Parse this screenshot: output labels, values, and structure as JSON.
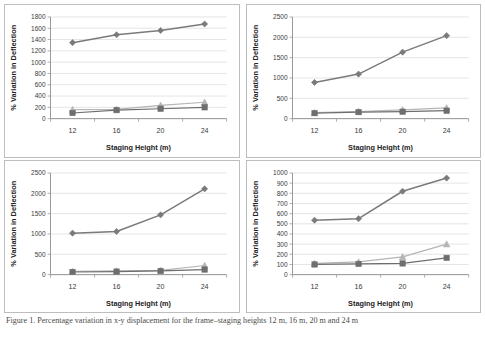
{
  "figure": {
    "caption": "Figure 1.  Percentage variation in x-y displacement for the frame–staging heights 12 m, 16 m, 20 m and 24 m",
    "background": "#ffffff",
    "panel_border": "#bdbdbd"
  },
  "style": {
    "series_colors": {
      "diamond": "#7a7a7a",
      "triangle": "#b5b5b5",
      "square": "#6e6e6e"
    },
    "gridline_color": "#d9d9d9",
    "axis_color": "#8c8c8c"
  },
  "chart_data": [
    {
      "id": "chart-top-left",
      "type": "line",
      "title": "",
      "xlabel": "Staging Height (m)",
      "ylabel": "% Variation  in Deflection",
      "categories": [
        "12",
        "16",
        "20",
        "24"
      ],
      "x": [
        12,
        16,
        20,
        24
      ],
      "ylim": [
        0,
        1800
      ],
      "ytick_step": 200,
      "yticks": [
        0,
        200,
        400,
        600,
        800,
        1000,
        1200,
        1400,
        1600,
        1800
      ],
      "grid": true,
      "legend": "none",
      "series": [
        {
          "name": "Series 1",
          "marker": "diamond",
          "color": "#7a7a7a",
          "values": [
            1345,
            1485,
            1560,
            1675
          ]
        },
        {
          "name": "Series 2",
          "marker": "triangle",
          "color": "#b5b5b5",
          "values": [
            160,
            165,
            235,
            290
          ]
        },
        {
          "name": "Series 3",
          "marker": "square",
          "color": "#6e6e6e",
          "values": [
            100,
            150,
            175,
            200
          ]
        }
      ]
    },
    {
      "id": "chart-top-right",
      "type": "line",
      "title": "",
      "xlabel": "Staging Height (m)",
      "ylabel": "% Variation  in Deflection",
      "categories": [
        "12",
        "16",
        "20",
        "24"
      ],
      "x": [
        12,
        16,
        20,
        24
      ],
      "ylim": [
        0,
        2500
      ],
      "ytick_step": 500,
      "yticks": [
        0,
        500,
        1000,
        1500,
        2000,
        2500
      ],
      "grid": true,
      "legend": "none",
      "series": [
        {
          "name": "Series 1",
          "marker": "diamond",
          "color": "#7a7a7a",
          "values": [
            890,
            1095,
            1635,
            2040
          ]
        },
        {
          "name": "Series 2",
          "marker": "triangle",
          "color": "#b5b5b5",
          "values": [
            150,
            175,
            215,
            265
          ]
        },
        {
          "name": "Series 3",
          "marker": "square",
          "color": "#6e6e6e",
          "values": [
            135,
            160,
            170,
            195
          ]
        }
      ]
    },
    {
      "id": "chart-bottom-left",
      "type": "line",
      "title": "",
      "xlabel": "Staging Height (m)",
      "ylabel": "% Variation  in Deflection",
      "categories": [
        "12",
        "16",
        "20",
        "24"
      ],
      "x": [
        12,
        16,
        20,
        24
      ],
      "ylim": [
        0,
        2500
      ],
      "ytick_step": 500,
      "yticks": [
        0,
        500,
        1000,
        1500,
        2000,
        2500
      ],
      "grid": true,
      "legend": "none",
      "series": [
        {
          "name": "Series 1",
          "marker": "diamond",
          "color": "#7a7a7a",
          "values": [
            1020,
            1060,
            1470,
            2110
          ]
        },
        {
          "name": "Series 2",
          "marker": "triangle",
          "color": "#b5b5b5",
          "values": [
            80,
            90,
            105,
            225
          ]
        },
        {
          "name": "Series 3",
          "marker": "square",
          "color": "#6e6e6e",
          "values": [
            65,
            75,
            90,
            125
          ]
        }
      ]
    },
    {
      "id": "chart-bottom-right",
      "type": "line",
      "title": "",
      "xlabel": "Staging Height (m)",
      "ylabel": "% Variation  in Deflection",
      "categories": [
        "12",
        "16",
        "20",
        "24"
      ],
      "x": [
        12,
        16,
        20,
        24
      ],
      "ylim": [
        0,
        1000
      ],
      "ytick_step": 100,
      "yticks": [
        0,
        100,
        200,
        300,
        400,
        500,
        600,
        700,
        800,
        900,
        1000
      ],
      "grid": true,
      "legend": "none",
      "series": [
        {
          "name": "Series 1",
          "marker": "diamond",
          "color": "#7a7a7a",
          "values": [
            535,
            550,
            820,
            950
          ]
        },
        {
          "name": "Series 2",
          "marker": "triangle",
          "color": "#b5b5b5",
          "values": [
            110,
            125,
            175,
            300
          ]
        },
        {
          "name": "Series 3",
          "marker": "square",
          "color": "#6e6e6e",
          "values": [
            100,
            105,
            110,
            165
          ]
        }
      ]
    }
  ]
}
